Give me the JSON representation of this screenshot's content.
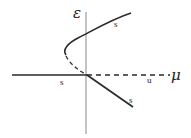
{
  "diagram": {
    "type": "bifurcation-diagram",
    "axes": {
      "vertical_label": "ε",
      "horizontal_label": "μ"
    },
    "branches": [
      {
        "name": "upper-stable-branch",
        "style": "solid",
        "label": "s"
      },
      {
        "name": "unstable-fold-branch",
        "style": "dashed",
        "label": ""
      },
      {
        "name": "left-trivial-stable-branch",
        "style": "solid",
        "label": "s"
      },
      {
        "name": "right-trivial-unstable-branch",
        "style": "dashed",
        "label": "u"
      },
      {
        "name": "lower-stable-branch",
        "style": "solid",
        "label": "s"
      }
    ],
    "colors": {
      "line": "#2a2a2a",
      "axis": "#8a8a8a",
      "background": "#ffffff"
    }
  }
}
